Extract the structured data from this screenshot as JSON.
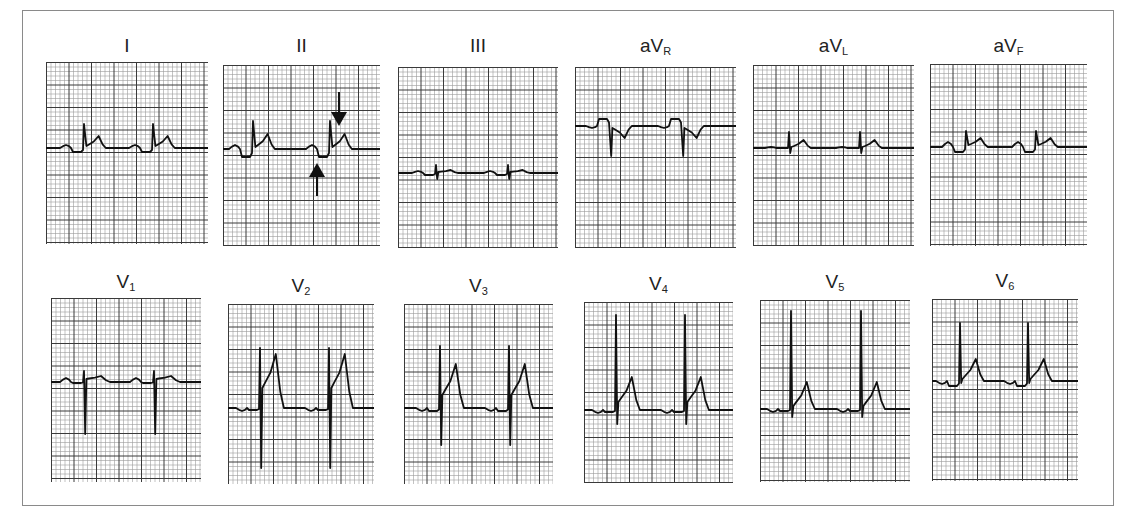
{
  "figure": {
    "grid": {
      "minor_px": 4.5,
      "major_every": 5,
      "minor_color": "#9a9a9a",
      "major_color": "#3a3a3a",
      "paper_color": "#ffffff",
      "trace_color": "#111111"
    },
    "annotations": [
      {
        "lead": "II",
        "type": "arrow-down",
        "x": 339,
        "y1": 92,
        "y2": 126,
        "points_to": "ST/T segment after QRS"
      },
      {
        "lead": "II",
        "type": "arrow-up",
        "x": 317,
        "y1": 196,
        "y2": 163,
        "points_to": "PR segment depression"
      }
    ]
  },
  "leads": [
    {
      "id": "I",
      "label": "I",
      "sub": "",
      "x": 46,
      "y": 62,
      "w": 162,
      "h": 182,
      "label_y": 36,
      "baseline": 86,
      "beats": [
        38,
        107
      ],
      "p": 3,
      "pr": -4,
      "q": 0,
      "r": 24,
      "s": 0,
      "st": 2,
      "t": 12,
      "tw": 8
    },
    {
      "id": "II",
      "label": "II",
      "sub": "",
      "x": 223,
      "y": 65,
      "w": 157,
      "h": 181,
      "label_y": 36,
      "baseline": 84,
      "beats": [
        30,
        107
      ],
      "p": 4,
      "pr": -8,
      "q": 0,
      "r": 28,
      "s": 0,
      "st": 2,
      "t": 15,
      "tw": 8
    },
    {
      "id": "III",
      "label": "III",
      "sub": "",
      "x": 398,
      "y": 67,
      "w": 160,
      "h": 181,
      "label_y": 36,
      "baseline": 106,
      "beats": [
        38,
        110
      ],
      "p": 2,
      "pr": -2,
      "q": 0,
      "r": 8,
      "s": -6,
      "st": 1,
      "t": 3,
      "tw": 8
    },
    {
      "id": "aVR",
      "label": "aV",
      "sub": "R",
      "x": 575,
      "y": 67,
      "w": 161,
      "h": 181,
      "label_y": 36,
      "baseline": 59,
      "beats": [
        35,
        107
      ],
      "p": -2,
      "pr": 7,
      "q": 0,
      "r": 0,
      "s": -30,
      "st": -2,
      "t": -12,
      "tw": 8
    },
    {
      "id": "aVL",
      "label": "aV",
      "sub": "L",
      "x": 753,
      "y": 65,
      "w": 161,
      "h": 181,
      "label_y": 36,
      "baseline": 83,
      "beats": [
        36,
        107
      ],
      "p": 1,
      "pr": 0,
      "q": 0,
      "r": 16,
      "s": -5,
      "st": 1,
      "t": 8,
      "tw": 8
    },
    {
      "id": "aVF",
      "label": "aV",
      "sub": "F",
      "x": 930,
      "y": 64,
      "w": 157,
      "h": 182,
      "label_y": 36,
      "baseline": 83,
      "beats": [
        36,
        106
      ],
      "p": 5,
      "pr": -5,
      "q": 0,
      "r": 16,
      "s": 0,
      "st": 2,
      "t": 9,
      "tw": 8
    },
    {
      "id": "V1",
      "label": "V",
      "sub": "1",
      "x": 51,
      "y": 298,
      "w": 150,
      "h": 184,
      "label_y": 272,
      "baseline": 84,
      "beats": [
        33,
        103
      ],
      "p": 4,
      "pr": -1,
      "q": 0,
      "r": 11,
      "s": -52,
      "st": 3,
      "t": 6,
      "tw": 10
    },
    {
      "id": "V2",
      "label": "V",
      "sub": "2",
      "x": 228,
      "y": 304,
      "w": 146,
      "h": 180,
      "label_y": 276,
      "baseline": 104,
      "beats": [
        32,
        101
      ],
      "p": -3,
      "pr": -2,
      "q": 0,
      "r": 60,
      "s": -60,
      "st": 20,
      "t": 54,
      "tw": 9
    },
    {
      "id": "V3",
      "label": "V",
      "sub": "3",
      "x": 404,
      "y": 304,
      "w": 149,
      "h": 180,
      "label_y": 276,
      "baseline": 104,
      "beats": [
        36,
        105
      ],
      "p": -3,
      "pr": -3,
      "q": 0,
      "r": 62,
      "s": -37,
      "st": 13,
      "t": 44,
      "tw": 9
    },
    {
      "id": "V4",
      "label": "V",
      "sub": "4",
      "x": 584,
      "y": 302,
      "w": 149,
      "h": 181,
      "label_y": 274,
      "baseline": 108,
      "beats": [
        32,
        101
      ],
      "p": -3,
      "pr": -2,
      "q": 0,
      "r": 95,
      "s": -14,
      "st": 8,
      "t": 33,
      "tw": 9
    },
    {
      "id": "V5",
      "label": "V",
      "sub": "5",
      "x": 760,
      "y": 300,
      "w": 150,
      "h": 182,
      "label_y": 272,
      "baseline": 109,
      "beats": [
        31,
        101
      ],
      "p": -3,
      "pr": -2,
      "q": 0,
      "r": 98,
      "s": -8,
      "st": 3,
      "t": 27,
      "tw": 9
    },
    {
      "id": "V6",
      "label": "V",
      "sub": "6",
      "x": 932,
      "y": 299,
      "w": 146,
      "h": 182,
      "label_y": 271,
      "baseline": 82,
      "beats": [
        28,
        96
      ],
      "p": -3,
      "pr": -5,
      "q": 0,
      "r": 58,
      "s": -2,
      "st": 2,
      "t": 22,
      "tw": 9
    }
  ],
  "chart_data": {
    "type": "line",
    "xlabel": "time (paper grid, ~2 beats per strip)",
    "ylabel": "amplitude (grid units)",
    "grid": true,
    "categories": [
      "I",
      "II",
      "III",
      "aVR",
      "aVL",
      "aVF",
      "V1",
      "V2",
      "V3",
      "V4",
      "V5",
      "V6"
    ],
    "series": [
      {
        "name": "R-wave amplitude (small boxes)",
        "values": [
          5,
          6,
          2,
          0,
          3.5,
          3.5,
          2.5,
          13,
          14,
          21,
          22,
          13
        ]
      },
      {
        "name": "S-wave depth (small boxes)",
        "values": [
          0,
          0,
          1.3,
          6.5,
          1,
          0,
          11.5,
          13,
          8,
          3,
          2,
          0.5
        ]
      },
      {
        "name": "T-wave amplitude (small boxes)",
        "values": [
          2.7,
          3.3,
          0.7,
          -2.7,
          1.8,
          2,
          1.3,
          12,
          9.8,
          7.3,
          6,
          4.9
        ]
      },
      {
        "name": "ST deviation (small boxes)",
        "values": [
          0.4,
          0.4,
          0.2,
          -0.4,
          0.2,
          0.4,
          0.7,
          4.4,
          2.9,
          1.8,
          0.7,
          0.4
        ]
      },
      {
        "name": "PR segment deviation (small boxes)",
        "values": [
          -0.9,
          -1.8,
          -0.4,
          1.6,
          0,
          -1.1,
          -0.2,
          -0.4,
          -0.7,
          -0.4,
          -0.4,
          -1.1
        ]
      }
    ],
    "annotations": [
      "Lead II: down arrow marks ST elevation",
      "Lead II: up arrow marks PR-segment depression"
    ]
  }
}
